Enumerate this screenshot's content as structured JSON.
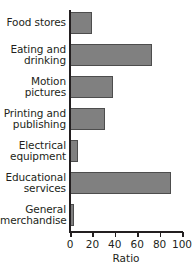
{
  "chart_data": {
    "type": "bar",
    "orientation": "horizontal",
    "title": "",
    "xlabel": "Ratio",
    "ylabel": "",
    "xlim": [
      0,
      100
    ],
    "xticks": [
      0,
      20,
      40,
      60,
      80,
      100
    ],
    "xtick_labels": [
      "0",
      "20",
      "40",
      "60",
      "80",
      "100"
    ],
    "grid": false,
    "legend": false,
    "bar_color": "#808080",
    "bar_edge_color": "#4d4d4d",
    "axis_color": "#231f20",
    "categories": [
      "Food stores",
      "Eating and\ndrinking",
      "Motion\npictures",
      "Printing and\npublishing",
      "Electrical\nequipment",
      "Educational\nservices",
      "General\nmerchandise"
    ],
    "values": [
      20,
      73,
      38,
      31,
      7,
      90,
      4
    ]
  }
}
